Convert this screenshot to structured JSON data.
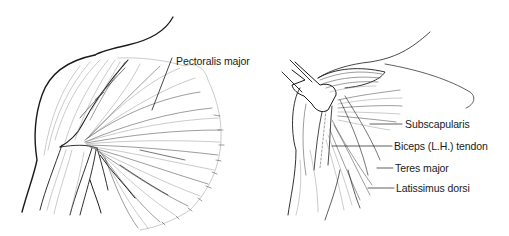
{
  "figure": {
    "left_view": {
      "labels": [
        {
          "id": "pectoralis-major",
          "text": "Pectoralis major",
          "x": 176,
          "y": 56
        }
      ]
    },
    "right_view": {
      "labels": [
        {
          "id": "subscapularis",
          "text": "Subscapularis",
          "x": 405,
          "y": 121
        },
        {
          "id": "biceps-lh-tendon",
          "text": "Biceps (L.H.) tendon",
          "x": 394,
          "y": 143
        },
        {
          "id": "teres-major",
          "text": "Teres major",
          "x": 395,
          "y": 165
        },
        {
          "id": "latissimus-dorsi",
          "text": "Latissimus dorsi",
          "x": 396,
          "y": 185
        }
      ]
    },
    "colors": {
      "background": "#ffffff",
      "ink": "#1a1a1a"
    }
  }
}
